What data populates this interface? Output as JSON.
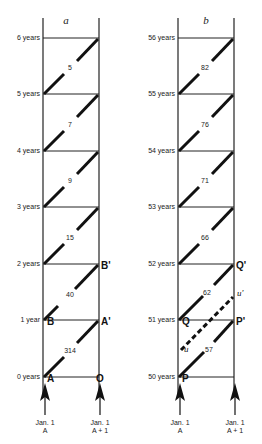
{
  "panels": [
    {
      "title": "a",
      "age_labels": [
        "0 years",
        "1 year",
        "2 years",
        "3 years",
        "4 years",
        "5 years",
        "6 years"
      ],
      "cohort_values": [
        "314",
        "40",
        "15",
        "9",
        "7",
        "5"
      ],
      "points": {
        "A": "A",
        "O": "O",
        "B": "B",
        "A_prime": "A'",
        "B_prime": "B'"
      },
      "axis": {
        "left_label_1": "Jan. 1",
        "left_label_2": "A",
        "right_label_1": "Jan. 1",
        "right_label_2": "A + 1"
      }
    },
    {
      "title": "b",
      "age_labels": [
        "50 years",
        "51 years",
        "52 years",
        "53 years",
        "54 years",
        "55 years",
        "56 years"
      ],
      "cohort_values": [
        "57",
        "62",
        "66",
        "71",
        "76",
        "82"
      ],
      "points": {
        "P": "P",
        "Q": "Q",
        "P_prime": "P'",
        "Q_prime": "Q'",
        "u": "u",
        "u_prime": "u'"
      },
      "axis": {
        "left_label_1": "Jan. 1",
        "left_label_2": "A",
        "right_label_1": "Jan. 1",
        "right_label_2": "A + 1"
      }
    }
  ]
}
